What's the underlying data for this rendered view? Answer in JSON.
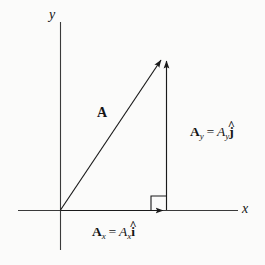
{
  "figure": {
    "kind": "vector-component-diagram",
    "background_color": "#fbfbfa",
    "ink_color": "#151515"
  },
  "axes": {
    "x_label": "x",
    "y_label": "y",
    "origin": [
      60,
      210
    ],
    "x_axis_from": [
      18,
      210
    ],
    "x_axis_to": [
      238,
      210
    ],
    "y_axis_from": [
      60,
      22
    ],
    "y_axis_to": [
      60,
      250
    ]
  },
  "vectors": {
    "resultant": {
      "label": "A",
      "from": [
        60,
        210
      ],
      "to": [
        162,
        58
      ]
    },
    "y_component": {
      "label_vector": "A",
      "label_vector_sub": "y",
      "equals": "=",
      "label_scalar": "A",
      "label_scalar_sub": "y",
      "unit_vector": "j",
      "unit_hat": "^",
      "from": [
        166,
        210
      ],
      "to": [
        166,
        58
      ]
    },
    "x_component": {
      "label_vector": "A",
      "label_vector_sub": "x",
      "equals": "=",
      "label_scalar": "A",
      "label_scalar_sub": "x",
      "unit_vector": "i",
      "unit_hat": "^",
      "from": [
        60,
        210
      ],
      "to": [
        168,
        210
      ]
    }
  },
  "right_angle_marker": {
    "corner": [
      167,
      210
    ],
    "size": 16
  }
}
